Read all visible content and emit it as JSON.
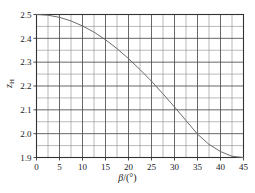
{
  "chart_data": {
    "type": "line",
    "title": "",
    "subtitle": "",
    "xlabel": "β/(°)",
    "xlabel_symbol": "β",
    "xlabel_unit": "/(°)",
    "ylabel": "z_H",
    "ylabel_symbol": "z",
    "ylabel_subscript": "H",
    "xlim": [
      0,
      45
    ],
    "ylim": [
      1.9,
      2.5
    ],
    "xticks": [
      0,
      5,
      10,
      15,
      20,
      25,
      30,
      35,
      40,
      45
    ],
    "xtick_labels": [
      "0",
      "5",
      "10",
      "15",
      "20",
      "25",
      "30",
      "35",
      "40",
      "45"
    ],
    "yticks": [
      1.9,
      2.0,
      2.1,
      2.2,
      2.3,
      2.4,
      2.5
    ],
    "ytick_labels": [
      "1.9",
      "2.0",
      "2.1",
      "2.2",
      "2.3",
      "2.4",
      "2.5"
    ],
    "x_minor_interval": 2.5,
    "y_minor_interval": 0.05,
    "grid": true,
    "grid_major_color": "#4d4d4d",
    "grid_minor_color": "#8c8c8c",
    "axis_color": "#333333",
    "line_color": "#6b6b6b",
    "line_width": 1.0,
    "legend": null,
    "legend_position": "none",
    "markers": false,
    "x": [
      0,
      2.5,
      5,
      7.5,
      10,
      12.5,
      15,
      17.5,
      20,
      22.5,
      25,
      27.5,
      30,
      32.5,
      35,
      37.5,
      40,
      42.5,
      45
    ],
    "series": [
      {
        "name": "zH",
        "values": [
          2.5,
          2.497,
          2.488,
          2.473,
          2.452,
          2.426,
          2.394,
          2.357,
          2.315,
          2.269,
          2.22,
          2.167,
          2.112,
          2.055,
          1.998,
          1.955,
          1.925,
          1.905,
          1.9
        ]
      }
    ],
    "annotations": []
  }
}
